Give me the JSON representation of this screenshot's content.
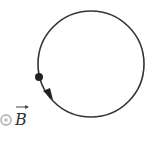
{
  "diagram": {
    "field_label": "B",
    "field_vector_arrow": "→",
    "field_direction": "out-of-page",
    "field_symbol": "circle-dot",
    "particle": "filled-dot",
    "motion_direction": "counterclockwise",
    "colors": {
      "stroke": "#333333",
      "field_symbol": "#bbbbbb",
      "background": "#ffffff"
    }
  }
}
